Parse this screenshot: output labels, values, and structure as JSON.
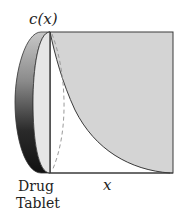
{
  "diagram": {
    "labels": {
      "concentration": "c(x)",
      "distance": "x",
      "tablet_line1": "Drug",
      "tablet_line2": "Tablet"
    },
    "colors": {
      "region_fill": "#d4d4d4",
      "outline": "#3a3a3a",
      "tablet_dark": "#1a1a1a",
      "tablet_light": "#e6e6e6",
      "dashed": "#9a9a9a",
      "background": "#ffffff"
    },
    "curve": {
      "type": "exponential-decay",
      "description": "Concentration c(x) decreasing from maximum at tablet surface to near zero at far right"
    }
  }
}
